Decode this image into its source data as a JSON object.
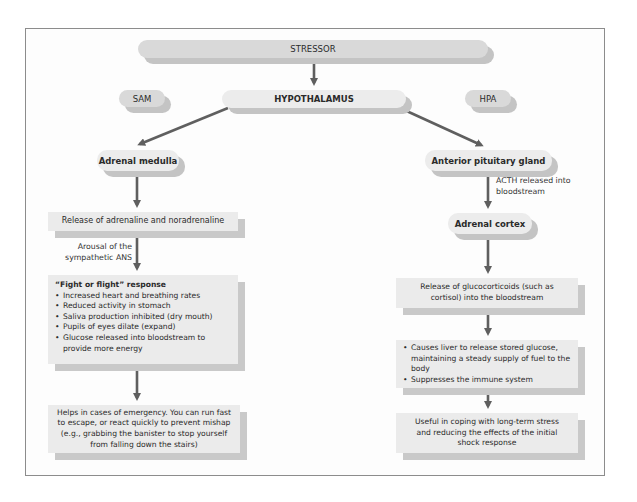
{
  "diagram": {
    "top": {
      "stressor": "STRESSOR",
      "hypothalamus": "HYPOTHALAMUS",
      "sam": "SAM",
      "hpa": "HPA"
    },
    "sam_branch": {
      "adrenal_medulla": "Adrenal medulla",
      "release": "Release of adrenaline and noradrenaline",
      "arousal_label_line1": "Arousal of the",
      "arousal_label_line2": "sympathetic ANS",
      "fight_heading": "“Fight or flight” response",
      "fight_items": [
        "Increased heart and breathing rates",
        "Reduced activity in stomach",
        "Saliva production inhibited (dry mouth)",
        "Pupils of eyes dilate (expand)",
        "Glucose released into bloodstream to provide more energy"
      ],
      "outcome": "Helps in cases of emergency. You can run fast to escape, or react quickly to prevent mishap (e.g., grabbing the banister to stop yourself from falling down the stairs)"
    },
    "hpa_branch": {
      "anterior_pituitary": "Anterior pituitary gland",
      "acth_label_line1": "ACTH released into",
      "acth_label_line2": "bloodstream",
      "adrenal_cortex": "Adrenal cortex",
      "glucocorticoids": "Release of glucocorticoids (such as cortisol) into the bloodstream",
      "effects": [
        "Causes liver to release stored glucose, maintaining a steady supply of fuel to the body",
        "Suppresses the immune system"
      ],
      "outcome": "Useful in coping with long-term stress and reducing the effects of the initial shock response"
    },
    "colors": {
      "arrow": "#5f5f5f",
      "pill_dark": "#d9d9d9",
      "pill_light": "#ececec",
      "box": "#ebebeb",
      "shadow": "#c4c4c4",
      "frame": "#8c8c8c"
    }
  }
}
